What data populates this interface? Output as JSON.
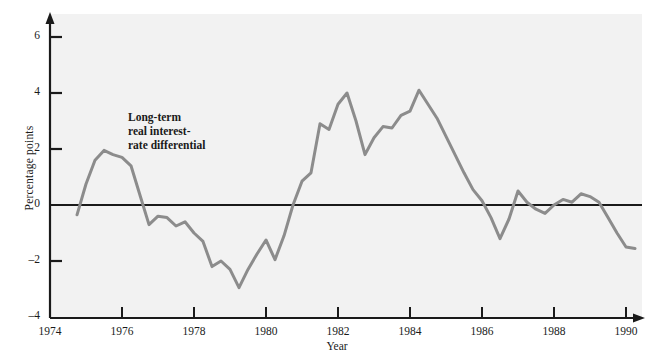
{
  "figure": {
    "background": "#f2f2f2",
    "line_color": "#8c8c8c",
    "axis_color": "#1a1a1a"
  },
  "annotation": {
    "text": "Long-term\nreal interest-\nrate differential"
  },
  "chart_data": {
    "type": "line",
    "title": "",
    "xlabel": "Year",
    "ylabel": "Percentage points",
    "xlim": [
      1974,
      1990.4
    ],
    "ylim": [
      -4,
      6
    ],
    "xticks": [
      1974,
      1976,
      1978,
      1980,
      1982,
      1984,
      1986,
      1988,
      1990
    ],
    "xticklabels": [
      "1974",
      "1976",
      "1978",
      "1980",
      "1982",
      "1984",
      "1986",
      "1988",
      "1990"
    ],
    "yticks": [
      -4,
      -2,
      0,
      2,
      4,
      6
    ],
    "yticklabels": [
      "–4",
      "–2",
      "0",
      "2",
      "4",
      "6"
    ],
    "grid": false,
    "legend": null,
    "zero_line": 0,
    "series": [
      {
        "name": "Long-term real interest-rate differential",
        "color": "#8c8c8c",
        "x": [
          1974.75,
          1975.0,
          1975.25,
          1975.5,
          1975.75,
          1976.0,
          1976.25,
          1976.5,
          1976.75,
          1977.0,
          1977.25,
          1977.5,
          1977.75,
          1978.0,
          1978.25,
          1978.5,
          1978.75,
          1979.0,
          1979.25,
          1979.5,
          1979.75,
          1980.0,
          1980.25,
          1980.5,
          1980.75,
          1981.0,
          1981.25,
          1981.5,
          1981.75,
          1982.0,
          1982.25,
          1982.5,
          1982.75,
          1983.0,
          1983.25,
          1983.5,
          1983.75,
          1984.0,
          1984.25,
          1984.5,
          1984.75,
          1985.0,
          1985.25,
          1985.5,
          1985.75,
          1986.0,
          1986.25,
          1986.5,
          1986.75,
          1987.0,
          1987.25,
          1987.5,
          1987.75,
          1988.0,
          1988.25,
          1988.5,
          1988.75,
          1989.0,
          1989.25,
          1989.5,
          1989.75,
          1990.0,
          1990.25
        ],
        "y": [
          -0.35,
          0.75,
          1.6,
          1.95,
          1.8,
          1.7,
          1.4,
          0.35,
          -0.7,
          -0.4,
          -0.45,
          -0.75,
          -0.6,
          -1.0,
          -1.3,
          -2.2,
          -2.0,
          -2.3,
          -2.95,
          -2.3,
          -1.75,
          -1.25,
          -1.95,
          -1.1,
          0.0,
          0.85,
          1.15,
          2.9,
          2.7,
          3.6,
          4.0,
          3.0,
          1.8,
          2.4,
          2.8,
          2.75,
          3.2,
          3.35,
          4.1,
          3.6,
          3.1,
          2.45,
          1.8,
          1.15,
          0.55,
          0.15,
          -0.45,
          -1.2,
          -0.5,
          0.5,
          0.1,
          -0.15,
          -0.3,
          0.0,
          0.2,
          0.1,
          0.4,
          0.3,
          0.1,
          -0.45,
          -1.0,
          -1.5,
          -1.55
        ]
      }
    ]
  }
}
